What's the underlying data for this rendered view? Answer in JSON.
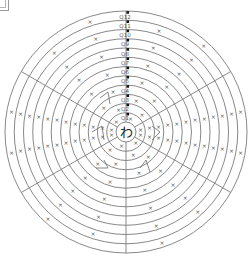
{
  "diagram": {
    "title": "",
    "center_char": "わ",
    "ring_labels": [
      "Q1",
      "Q2",
      "Q3",
      "Q4",
      "Q5",
      "Q6",
      "Q7",
      "Q8",
      "Q9",
      "Q10",
      "Q11",
      "Q12"
    ],
    "mark_glyph": "×",
    "ring_count": 12,
    "sector_count": 6,
    "colors": {
      "line": "#7a7a7a",
      "marker": "#111111",
      "text": "#555555"
    }
  }
}
